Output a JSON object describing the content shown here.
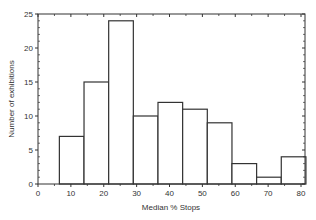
{
  "chart_data": {
    "type": "bar",
    "subtype": "histogram",
    "title": "",
    "xlabel": "Median % Stops",
    "ylabel": "Number of exhibitions",
    "xlim": [
      0,
      80
    ],
    "ylim": [
      0,
      25
    ],
    "xticks": [
      0,
      10,
      20,
      30,
      40,
      50,
      60,
      70,
      80
    ],
    "yticks": [
      0,
      5,
      10,
      15,
      20,
      25
    ],
    "grid": false,
    "legend": null,
    "bins": [
      {
        "start": 6.5,
        "end": 14,
        "count": 7
      },
      {
        "start": 14,
        "end": 21.5,
        "count": 15
      },
      {
        "start": 21.5,
        "end": 29,
        "count": 24
      },
      {
        "start": 29,
        "end": 36.5,
        "count": 10
      },
      {
        "start": 36.5,
        "end": 44,
        "count": 12
      },
      {
        "start": 44,
        "end": 51.5,
        "count": 11
      },
      {
        "start": 51.5,
        "end": 59,
        "count": 9
      },
      {
        "start": 59,
        "end": 66.5,
        "count": 3
      },
      {
        "start": 66.5,
        "end": 74,
        "count": 1
      },
      {
        "start": 74,
        "end": 81.5,
        "count": 4
      }
    ],
    "categories": [
      "6.5-14",
      "14-21.5",
      "21.5-29",
      "29-36.5",
      "36.5-44",
      "44-51.5",
      "51.5-59",
      "59-66.5",
      "66.5-74",
      "74-81.5"
    ],
    "values": [
      7,
      15,
      24,
      10,
      12,
      11,
      9,
      3,
      1,
      4
    ]
  },
  "colors": {
    "bar_fill": "#ffffff",
    "bar_stroke": "#333333",
    "axis": "#333333"
  }
}
